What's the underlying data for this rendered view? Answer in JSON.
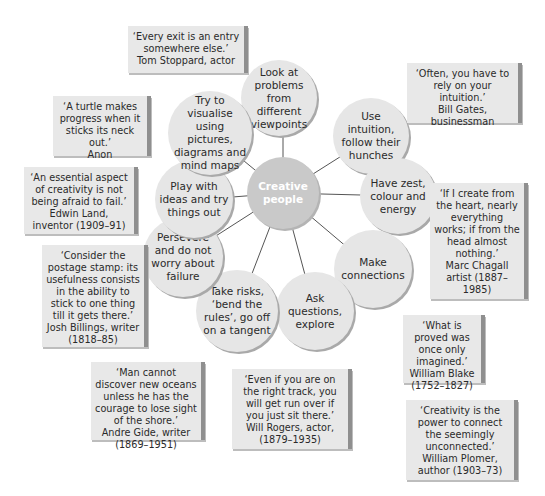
{
  "center": {
    "label_line1": "Creative",
    "label_line2": "people"
  },
  "traits": [
    {
      "text": "Look at problems from different viewpoints"
    },
    {
      "text": "Use intuition, follow their hunches"
    },
    {
      "text": "Have zest, colour and energy"
    },
    {
      "text": "Make connections"
    },
    {
      "text": "Ask questions, explore"
    },
    {
      "text": "Take risks, ‘bend the rules’, go off on a tangent"
    },
    {
      "text": "Persevere and do not worry about failure"
    },
    {
      "text": "Play with ideas and try things out"
    },
    {
      "text": "Try to visualise using pictures, diagrams and mind maps"
    }
  ],
  "quotes": [
    {
      "quote": "‘Every exit is an entry somewhere else.’",
      "author": "Tom Stoppard, actor"
    },
    {
      "quote": "‘Often, you have to rely on your intuition.’",
      "author": "Bill Gates, businessman"
    },
    {
      "quote": "‘A turtle makes progress when it sticks its neck out.’",
      "author": "Anon"
    },
    {
      "quote": "‘An essential aspect of creativity is not being afraid to fail.’",
      "author": "Edwin Land, inventor (1909–91)"
    },
    {
      "quote": "‘If I create from the heart, nearly everything works; if from the head almost nothing.’",
      "author": "Marc Chagall artist (1887–1985)"
    },
    {
      "quote": "‘Consider the postage stamp: its usefulness consists in the ability to stick to one thing till it gets there.’",
      "author": "Josh Billings, writer (1818–85)"
    },
    {
      "quote": "‘What is proved was once only imagined.’",
      "author": "William Blake (1752–1827)"
    },
    {
      "quote": "‘Man cannot discover new oceans unless he has the courage to lose sight of the shore.’",
      "author": "Andre Gide, writer (1869–1951)"
    },
    {
      "quote": "‘Even if you are on the right track, you will get run over if you just sit there.’",
      "author": "Will Rogers, actor, (1879–1935)"
    },
    {
      "quote": "‘Creativity is the power to connect the seemingly unconnected.’",
      "author": "William Plomer, author (1903–73)"
    }
  ]
}
